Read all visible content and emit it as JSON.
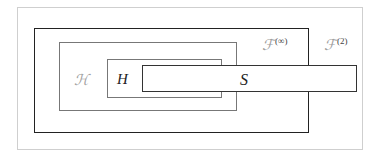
{
  "diagram": {
    "type": "nested-set-diagram",
    "sets": [
      {
        "id": "F2",
        "label": "𝒯",
        "symbol": "F",
        "superscript": "(2)",
        "description": "outer region"
      },
      {
        "id": "Finf",
        "label": "𝒯",
        "symbol": "F",
        "superscript": "(∞)",
        "description": "box containing ℋ"
      },
      {
        "id": "Hcal",
        "label": "ℋ",
        "description": "box containing H"
      },
      {
        "id": "H",
        "label": "H",
        "description": "innermost box"
      },
      {
        "id": "S",
        "label": "S",
        "description": "horizontal box overlapping H, ℋ and F(∞), extending outside"
      }
    ],
    "labels": {
      "f2_base": "ℱ",
      "f2_sup": "(2)",
      "finf_base": "ℱ",
      "finf_sup": "(∞)",
      "hcal": "ℋ",
      "h": "H",
      "s": "S"
    },
    "colors": {
      "frame": "#cfcfcf",
      "f_inf_border": "#222222",
      "inner_border": "#777777",
      "s_border": "#333333",
      "script_label": "#a0a0a0"
    }
  }
}
